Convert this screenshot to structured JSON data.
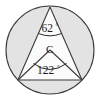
{
  "figure": {
    "shape_type": "circle-with-inscribed-triangle",
    "center_label": "C",
    "inscribed_angle": {
      "value": "62",
      "degree_symbol": "°",
      "vertex": "top",
      "full_text": "62°"
    },
    "central_angle": {
      "value": "122",
      "degree_symbol": "°",
      "vertex": "center",
      "full_text": "122°"
    },
    "colors": {
      "circle_fill": "#e3e3e3",
      "triangle_fill": "#fbfbfb",
      "stroke": "#3b3b3b",
      "arc_stroke": "#2b2b2b",
      "text": "#1a1a1a",
      "background": "#ffffff"
    },
    "geometry": {
      "circle_center_x": "50",
      "circle_center_y": "50",
      "circle_radius": "44",
      "apex_x": "50",
      "apex_y": "7",
      "left_vertex_x": "18",
      "left_vertex_y": "80",
      "right_vertex_x": "82",
      "right_vertex_y": "80"
    }
  }
}
